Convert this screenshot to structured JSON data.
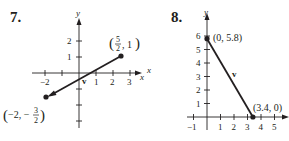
{
  "figures": [
    {
      "number": "7.",
      "axes": {
        "x_label": "x",
        "y_label": "y",
        "x_ticks": [
          "−2",
          "1",
          "2",
          "3"
        ],
        "y_ticks": [
          "2",
          "1"
        ],
        "x_range": [
          -2.5,
          3.5
        ],
        "y_range": [
          -3,
          2.6
        ]
      },
      "vector": {
        "label": "v",
        "tail": {
          "x": 2.5,
          "y": 1,
          "label_text": "(5/2, 1)"
        },
        "head": {
          "x": -2,
          "y": -1.5,
          "label_text": "(−2, −3/2)"
        }
      }
    },
    {
      "number": "8.",
      "axes": {
        "x_label": "x",
        "y_label": "y",
        "x_ticks": [
          "−1",
          "1",
          "2",
          "3",
          "4",
          "5"
        ],
        "y_ticks": [
          "6",
          "5",
          "4",
          "3",
          "2",
          "1"
        ],
        "x_range": [
          -1.5,
          5.7
        ],
        "y_range": [
          -0.5,
          6.6
        ]
      },
      "vector": {
        "label": "v",
        "tail": {
          "x": 0,
          "y": 5.8,
          "label_text": "(0, 5.8)"
        },
        "head": {
          "x": 3.4,
          "y": 0,
          "label_text": "(3.4, 0)"
        }
      }
    }
  ],
  "colors": {
    "ink": "#231f20",
    "background": "#ffffff"
  }
}
